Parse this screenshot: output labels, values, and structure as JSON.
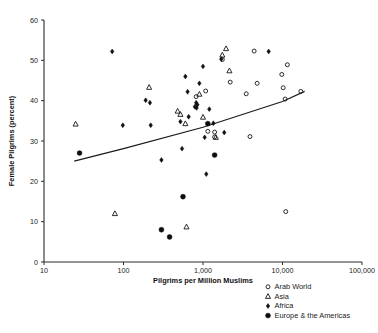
{
  "chart_data": {
    "type": "scatter",
    "title": "",
    "xlabel": "Pilgrims per Million Muslims",
    "ylabel": "Female Pilgrims (percent)",
    "xscale": "log",
    "yscale": "linear",
    "xlim": [
      10,
      100000
    ],
    "ylim": [
      0,
      60
    ],
    "xticks": [
      10,
      100,
      1000,
      10000,
      100000
    ],
    "xtick_labels": [
      "10",
      "100",
      "1,000",
      "10,000",
      "100,000"
    ],
    "yticks": [
      0,
      10,
      20,
      30,
      40,
      50,
      60
    ],
    "ytick_labels": [
      "0",
      "10",
      "20",
      "30",
      "40",
      "50",
      "60"
    ],
    "grid": false,
    "legend_position": "below-right",
    "series": [
      {
        "name": "Arab World",
        "marker": "open-circle",
        "points": [
          [
            820,
            41.0
          ],
          [
            1080,
            42.4
          ],
          [
            1150,
            32.4
          ],
          [
            1400,
            32.2
          ],
          [
            1400,
            31.0
          ],
          [
            1750,
            50.2
          ],
          [
            2200,
            44.6
          ],
          [
            3500,
            41.7
          ],
          [
            3900,
            31.1
          ],
          [
            4400,
            52.3
          ],
          [
            4800,
            44.3
          ],
          [
            9800,
            46.5
          ],
          [
            10200,
            43.2
          ],
          [
            10800,
            40.4
          ],
          [
            11000,
            12.5
          ],
          [
            11500,
            48.9
          ],
          [
            17000,
            42.3
          ]
        ]
      },
      {
        "name": "Asia",
        "marker": "open-triangle",
        "points": [
          [
            25,
            34.2
          ],
          [
            78,
            12.0
          ],
          [
            210,
            43.3
          ],
          [
            480,
            37.4
          ],
          [
            520,
            36.6
          ],
          [
            600,
            34.3
          ],
          [
            620,
            8.7
          ],
          [
            900,
            41.6
          ],
          [
            1000,
            35.9
          ],
          [
            1450,
            30.9
          ],
          [
            1750,
            51.3
          ],
          [
            1950,
            52.9
          ],
          [
            2150,
            47.4
          ]
        ]
      },
      {
        "name": "Africa",
        "marker": "diamond",
        "points": [
          [
            72,
            52.2
          ],
          [
            98,
            33.9
          ],
          [
            190,
            40.1
          ],
          [
            215,
            39.5
          ],
          [
            220,
            33.9
          ],
          [
            300,
            25.3
          ],
          [
            520,
            34.8
          ],
          [
            545,
            28.1
          ],
          [
            600,
            46.0
          ],
          [
            640,
            42.2
          ],
          [
            660,
            36.0
          ],
          [
            790,
            38.5
          ],
          [
            820,
            39.5
          ],
          [
            830,
            38.2
          ],
          [
            850,
            39.0
          ],
          [
            900,
            44.3
          ],
          [
            1000,
            48.5
          ],
          [
            1050,
            30.9
          ],
          [
            1100,
            21.8
          ],
          [
            1200,
            37.9
          ],
          [
            1350,
            34.4
          ],
          [
            1700,
            50.3
          ],
          [
            1850,
            32.1
          ],
          [
            6700,
            52.2
          ]
        ]
      },
      {
        "name": "Europe & the Americas",
        "marker": "filled-circle",
        "points": [
          [
            28,
            27.0
          ],
          [
            300,
            8.0
          ],
          [
            380,
            6.2
          ],
          [
            560,
            16.2
          ],
          [
            1150,
            34.3
          ],
          [
            1400,
            26.5
          ]
        ]
      }
    ],
    "trend_line": {
      "description": "fitted regression line",
      "points": [
        [
          24,
          25.0
        ],
        [
          100,
          28.1
        ],
        [
          1000,
          33.4
        ],
        [
          10000,
          39.8
        ],
        [
          19000,
          42.3
        ]
      ]
    }
  },
  "legend": {
    "entries": [
      {
        "label": "Arab World",
        "marker": "open-circle"
      },
      {
        "label": "Asia",
        "marker": "open-triangle"
      },
      {
        "label": "Africa",
        "marker": "diamond"
      },
      {
        "label": "Europe & the Americas",
        "marker": "filled-circle"
      }
    ]
  }
}
